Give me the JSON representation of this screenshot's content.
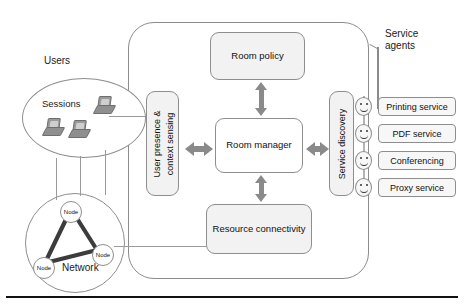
{
  "diagram": {
    "colors": {
      "box_fill": "#f2f2f2",
      "box_stroke": "#8e8e8e",
      "arrow_gray": "#8a8a8a",
      "boundary_stroke": "#8c8c8c",
      "rule_black": "#111111"
    },
    "system_boundary": {
      "label": ""
    },
    "core_boxes": [
      {
        "id": "room-policy",
        "label": "Room policy"
      },
      {
        "id": "room-manager",
        "label": "Room manager"
      },
      {
        "id": "resource-connectivity",
        "label": "Resource connectivity"
      }
    ],
    "side_panels": [
      {
        "id": "user-presence",
        "line1": "User presence &",
        "line2": "context sensing"
      },
      {
        "id": "service-discovery",
        "line1": "Service discovery"
      }
    ],
    "left_groups": {
      "users_label": "Users",
      "sessions_label": "Sessions",
      "network_label": "Network",
      "nodes": [
        {
          "label": "Node"
        },
        {
          "label": "Node"
        },
        {
          "label": "Node"
        }
      ]
    },
    "service_agents": {
      "group_label_line1": "Service",
      "group_label_line2": "agents",
      "items": [
        {
          "label": "Printing service",
          "icon": "smiley-agent-icon"
        },
        {
          "label": "PDF service",
          "icon": "smiley-agent-icon"
        },
        {
          "label": "Conferencing",
          "icon": "smiley-agent-icon"
        },
        {
          "label": "Proxy service",
          "icon": "smiley-agent-icon"
        }
      ]
    },
    "connectors": [
      {
        "from": "user-presence",
        "to": "room-manager",
        "style": "double-arrow"
      },
      {
        "from": "room-manager",
        "to": "service-discovery",
        "style": "double-arrow"
      },
      {
        "from": "room-manager",
        "to": "room-policy",
        "style": "double-arrow"
      },
      {
        "from": "resource-connectivity",
        "to": "room-manager",
        "style": "double-arrow"
      }
    ]
  }
}
